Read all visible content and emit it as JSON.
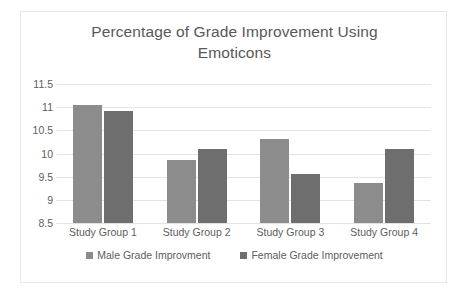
{
  "chart_data": {
    "type": "bar",
    "title": "Percentage of Grade Improvement Using Emoticons",
    "title_lines": [
      "Percentage of Grade Improvement Using",
      "Emoticons"
    ],
    "xlabel": "",
    "ylabel": "",
    "ylim": [
      8.5,
      11.5
    ],
    "ytick_step": 0.5,
    "yticks": [
      "11.5",
      "11",
      "10.5",
      "10",
      "9.5",
      "9",
      "8.5"
    ],
    "grid": true,
    "legend_position": "bottom",
    "categories": [
      "Study Group 1",
      "Study Group 2",
      "Study Group 3",
      "Study Group 4"
    ],
    "series": [
      {
        "name": "Male Grade Improvment",
        "color": "#8c8c8c",
        "values": [
          11.05,
          9.87,
          10.31,
          9.36
        ]
      },
      {
        "name": "Female Grade Improvement",
        "color": "#6e6e6e",
        "values": [
          10.92,
          10.09,
          9.56,
          10.09
        ]
      }
    ]
  },
  "legend": {
    "items": [
      {
        "label": "Male Grade Improvment",
        "color": "#8c8c8c"
      },
      {
        "label": "Female Grade Improvement",
        "color": "#6e6e6e"
      }
    ]
  }
}
